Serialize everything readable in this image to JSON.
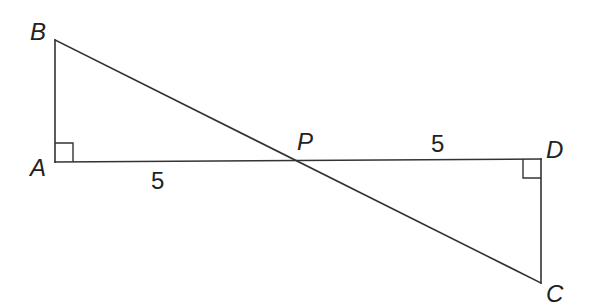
{
  "diagram": {
    "type": "geometry",
    "points": {
      "A": {
        "label": "A",
        "x": 55,
        "y": 162
      },
      "B": {
        "label": "B",
        "x": 55,
        "y": 40
      },
      "P": {
        "label": "P",
        "x": 295,
        "y": 161
      },
      "D": {
        "label": "D",
        "x": 541,
        "y": 159
      },
      "C": {
        "label": "C",
        "x": 541,
        "y": 283
      }
    },
    "segments": [
      {
        "from": "A",
        "to": "B"
      },
      {
        "from": "A",
        "to": "D"
      },
      {
        "from": "B",
        "to": "C"
      },
      {
        "from": "D",
        "to": "C"
      }
    ],
    "right_angles": [
      {
        "vertex": "A",
        "between": [
          "B",
          "D"
        ]
      },
      {
        "vertex": "D",
        "between": [
          "A",
          "C"
        ]
      }
    ],
    "lengths": [
      {
        "segment": "AP",
        "label": "5"
      },
      {
        "segment": "PD",
        "label": "5"
      }
    ],
    "stroke_color": "#333333",
    "text_color": "#222222"
  }
}
